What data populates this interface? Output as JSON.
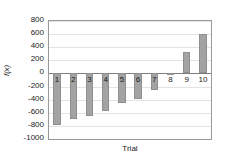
{
  "chart_data": {
    "type": "bar",
    "title": "",
    "xlabel": "Trial",
    "ylabel": "f(x)",
    "categories": [
      "1",
      "2",
      "3",
      "4",
      "5",
      "6",
      "7",
      "8",
      "9",
      "10"
    ],
    "values": [
      -790,
      -690,
      -650,
      -570,
      -455,
      -385,
      -255,
      -25,
      325,
      595
    ],
    "ylim": [
      -1000,
      800
    ],
    "ytick_labels": [
      "800",
      "600",
      "400",
      "200",
      "0",
      "-200",
      "-400",
      "-600",
      "-800",
      "-1000"
    ],
    "ytick_values": [
      800,
      600,
      400,
      200,
      0,
      -200,
      -400,
      -600,
      -800,
      -1000
    ],
    "grid": true,
    "legend": false,
    "bar_color": "#a3a3a3",
    "bar_edge_color": "#8f8f8f",
    "axis_color": "#9a9a9a",
    "grid_color": "#e4e4e4",
    "text_color": "#1a1a1a"
  }
}
